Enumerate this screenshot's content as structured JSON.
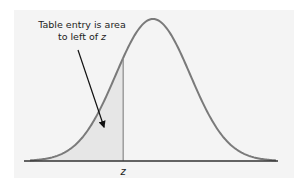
{
  "diagram": {
    "annotation_line1": "Table entry is area",
    "annotation_line2_prefix": "to left of ",
    "annotation_line2_var": "z",
    "axis_label": "z",
    "z_value": -0.8,
    "x_range": [
      -3.3,
      3.3
    ],
    "colors": {
      "panel": "#f4f4f4",
      "curve": "#7a7a7a",
      "shade": "#e6e6e6",
      "axis": "#333333",
      "arrow": "#111111"
    }
  }
}
